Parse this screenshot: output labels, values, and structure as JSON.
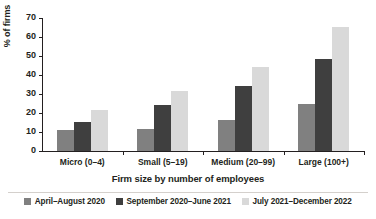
{
  "chart_data": {
    "type": "bar",
    "title": "",
    "subtitle": "",
    "xlabel": "Firm size by number of employees",
    "ylabel": "% of firms",
    "categories": [
      "Micro (0–4)",
      "Small (5–19)",
      "Medium (20–99)",
      "Large (100+)"
    ],
    "series": [
      {
        "name": "April–August 2020",
        "color": "#808080",
        "values": [
          10.8,
          11.5,
          16.2,
          24.8
        ]
      },
      {
        "name": "September 2020–June 2021",
        "color": "#3f3f3f",
        "values": [
          15.1,
          24.0,
          34.2,
          48.4
        ]
      },
      {
        "name": "July 2021–December 2022",
        "color": "#d9d9d9",
        "values": [
          21.7,
          31.7,
          44.4,
          65.5
        ]
      }
    ],
    "ylim": [
      0,
      70
    ],
    "yticks": [
      0,
      10,
      20,
      30,
      40,
      50,
      60,
      70
    ],
    "ytick_labels": [
      "0",
      "10",
      "20",
      "30",
      "40",
      "50",
      "60",
      "70"
    ],
    "grid": false,
    "legend_position": "bottom",
    "orientation": "vertical",
    "grouping": "clustered"
  },
  "axes": {
    "y_title": "% of firms",
    "x_title": "Firm size by number of employees"
  },
  "legend": {
    "entries": [
      {
        "label": "April–August 2020",
        "color": "#808080"
      },
      {
        "label": "September 2020–June 2021",
        "color": "#3f3f3f"
      },
      {
        "label": "July 2021–December 2022",
        "color": "#d9d9d9"
      }
    ]
  }
}
